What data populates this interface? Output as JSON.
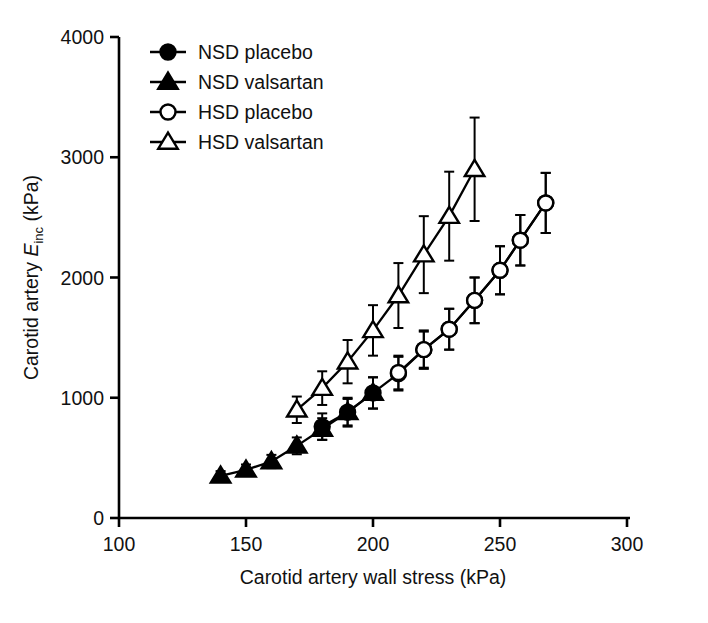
{
  "figure": {
    "background": "#ffffff",
    "ink_color": "#000000"
  },
  "axes": {
    "x": {
      "label": "Carotid artery wall stress (kPa)",
      "ticks": [
        100,
        150,
        200,
        250,
        300
      ],
      "tick_labels": [
        "100",
        "150",
        "200",
        "250",
        "300"
      ],
      "min": 100,
      "max": 300
    },
    "y": {
      "label_prefix": "Carotid artery ",
      "label_symbol": "E",
      "label_subscript": "inc",
      "label_suffix": " (kPa)",
      "label_full": "Carotid artery Einc (kPa)",
      "ticks": [
        0,
        1000,
        2000,
        3000,
        4000
      ],
      "tick_labels": [
        "0",
        "1000",
        "2000",
        "3000",
        "4000"
      ],
      "min": 0,
      "max": 4000
    }
  },
  "legend": {
    "position": "top-left-inside",
    "entries": [
      {
        "label": "NSD placebo",
        "marker": "filled-circle",
        "key": "nsd_placebo"
      },
      {
        "label": "NSD valsartan",
        "marker": "filled-triangle",
        "key": "nsd_valsartan"
      },
      {
        "label": "HSD placebo",
        "marker": "open-circle",
        "key": "hsd_placebo"
      },
      {
        "label": "HSD valsartan",
        "marker": "open-triangle",
        "key": "hsd_valsartan"
      }
    ]
  },
  "chart_data": {
    "type": "line",
    "title": "",
    "xlabel": "Carotid artery wall stress (kPa)",
    "ylabel": "Carotid artery Einc (kPa)",
    "xlim": [
      100,
      300
    ],
    "ylim": [
      0,
      4000
    ],
    "xticks": [
      100,
      150,
      200,
      250,
      300
    ],
    "yticks": [
      0,
      1000,
      2000,
      3000,
      4000
    ],
    "grid": false,
    "legend_position": "upper left",
    "error_bars": "vertical, symmetric (SEM)",
    "series": [
      {
        "name": "NSD placebo",
        "marker": "filled-circle",
        "x": [
          180,
          190,
          200,
          210,
          220,
          230,
          240,
          250,
          258,
          268
        ],
        "y": [
          760,
          880,
          1040,
          1200,
          1400,
          1570,
          1810,
          2060,
          2310,
          2620
        ],
        "yerr": [
          110,
          120,
          130,
          140,
          150,
          170,
          190,
          200,
          210,
          250
        ]
      },
      {
        "name": "NSD valsartan",
        "marker": "filled-triangle",
        "x": [
          140,
          150,
          160,
          170,
          180,
          190,
          200
        ],
        "y": [
          350,
          400,
          470,
          600,
          740,
          880,
          1040
        ],
        "yerr": [
          40,
          45,
          55,
          70,
          90,
          110,
          130
        ]
      },
      {
        "name": "HSD placebo",
        "marker": "open-circle",
        "x": [
          210,
          220,
          230,
          240,
          250,
          258,
          268
        ],
        "y": [
          1210,
          1400,
          1570,
          1810,
          2060,
          2310,
          2620
        ],
        "yerr": [
          140,
          160,
          170,
          190,
          200,
          210,
          250
        ]
      },
      {
        "name": "HSD valsartan",
        "marker": "open-triangle",
        "x": [
          170,
          180,
          190,
          200,
          210,
          220,
          230,
          240
        ],
        "y": [
          900,
          1080,
          1300,
          1560,
          1850,
          2190,
          2510,
          2900
        ],
        "yerr": [
          110,
          140,
          180,
          210,
          270,
          320,
          370,
          430
        ]
      }
    ]
  }
}
